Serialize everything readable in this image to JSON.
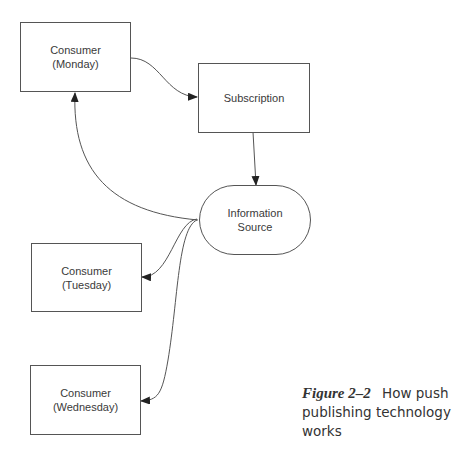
{
  "diagram": {
    "nodes": [
      {
        "id": "monday",
        "line1": "Consumer",
        "line2": "(Monday)"
      },
      {
        "id": "subscription",
        "line1": "Subscription"
      },
      {
        "id": "source",
        "line1": "Information",
        "line2": "Source"
      },
      {
        "id": "tuesday",
        "line1": "Consumer",
        "line2": "(Tuesday)"
      },
      {
        "id": "wednesday",
        "line1": "Consumer",
        "line2": "(Wednesday)"
      }
    ],
    "edges": [
      {
        "from": "monday",
        "to": "subscription"
      },
      {
        "from": "subscription",
        "to": "source"
      },
      {
        "from": "source",
        "to": "monday"
      },
      {
        "from": "source",
        "to": "tuesday"
      },
      {
        "from": "source",
        "to": "wednesday"
      }
    ]
  },
  "caption": {
    "figure_label": "Figure 2–2",
    "text": "How push publishing technology works"
  }
}
